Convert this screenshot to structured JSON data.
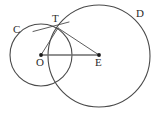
{
  "figure": {
    "type": "geometry-diagram",
    "width": 159,
    "height": 117,
    "background_color": "#ffffff",
    "stroke_color": "#4a4a4a",
    "dot_color": "#1a1a1a",
    "labels": [
      {
        "id": "C",
        "text": "C",
        "x": 14,
        "y": 26,
        "role": "circle-name-left"
      },
      {
        "id": "D",
        "text": "D",
        "x": 137,
        "y": 9,
        "role": "circle-name-right"
      },
      {
        "id": "T",
        "text": "T",
        "x": 52,
        "y": 15,
        "role": "intersection-point"
      },
      {
        "id": "O",
        "text": "O",
        "x": 35,
        "y": 57,
        "role": "center-left"
      },
      {
        "id": "E",
        "text": "E",
        "x": 95,
        "y": 57,
        "role": "center-right"
      }
    ],
    "circles": [
      {
        "id": "C",
        "cx": 41,
        "cy": 55,
        "r": 31
      },
      {
        "id": "D",
        "cx": 99,
        "cy": 56,
        "r": 51
      }
    ],
    "points": [
      {
        "id": "O",
        "x": 41,
        "y": 55
      },
      {
        "id": "E",
        "x": 99,
        "y": 55
      },
      {
        "id": "T",
        "x": 58,
        "y": 28
      }
    ],
    "segments": [
      {
        "id": "OT",
        "from": "O",
        "to": "T",
        "weight": "thin"
      },
      {
        "id": "TE",
        "from": "T",
        "to": "E",
        "weight": "thin"
      },
      {
        "id": "OE",
        "from": "O",
        "to": "E",
        "weight": "thick"
      },
      {
        "id": "tangent",
        "from": "tangent-start",
        "to": "tangent-end",
        "weight": "thin"
      }
    ],
    "tangent_line": {
      "x1": 33,
      "y1": 31,
      "x2": 68,
      "y2": 22
    }
  }
}
